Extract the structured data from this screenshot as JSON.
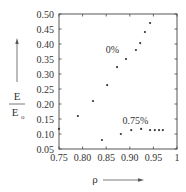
{
  "chart_data": {
    "type": "scatter",
    "title": "",
    "xlabel": "ρ",
    "ylabel_numerator": "E",
    "ylabel_denominator": "E",
    "ylabel_subscript": "o",
    "xlim": [
      0.75,
      1.0
    ],
    "ylim": [
      0.05,
      0.5
    ],
    "grid": false,
    "legend": "inline labels",
    "x_ticks": [
      0.75,
      0.8,
      0.85,
      0.9,
      0.95,
      1.0
    ],
    "x_tick_labels": [
      "0.75",
      "0.80",
      "0.85",
      "0.90",
      "0.95",
      "1"
    ],
    "y_ticks": [
      0.05,
      0.1,
      0.15,
      0.2,
      0.25,
      0.3,
      0.35,
      0.4,
      0.45,
      0.5
    ],
    "y_tick_labels": [
      "0.05",
      "0.10",
      "0.15",
      "0.20",
      "0.25",
      "0.30",
      "0.35",
      "0.40",
      "0.45",
      "0.50"
    ],
    "series": [
      {
        "name": "0%",
        "label_pos": [
          0.863,
          0.37
        ],
        "x": [
          0.79,
          0.822,
          0.852,
          0.873,
          0.892,
          0.913,
          0.922,
          0.932,
          0.943
        ],
        "y": [
          0.16,
          0.21,
          0.263,
          0.323,
          0.35,
          0.38,
          0.403,
          0.44,
          0.47
        ]
      },
      {
        "name": "0.75%",
        "label_pos": [
          0.912,
          0.135
        ],
        "x": [
          0.75,
          0.841,
          0.881,
          0.903,
          0.924,
          0.943,
          0.953,
          0.962,
          0.97
        ],
        "y": [
          0.117,
          0.08,
          0.1,
          0.113,
          0.117,
          0.113,
          0.113,
          0.113,
          0.113
        ]
      }
    ]
  }
}
